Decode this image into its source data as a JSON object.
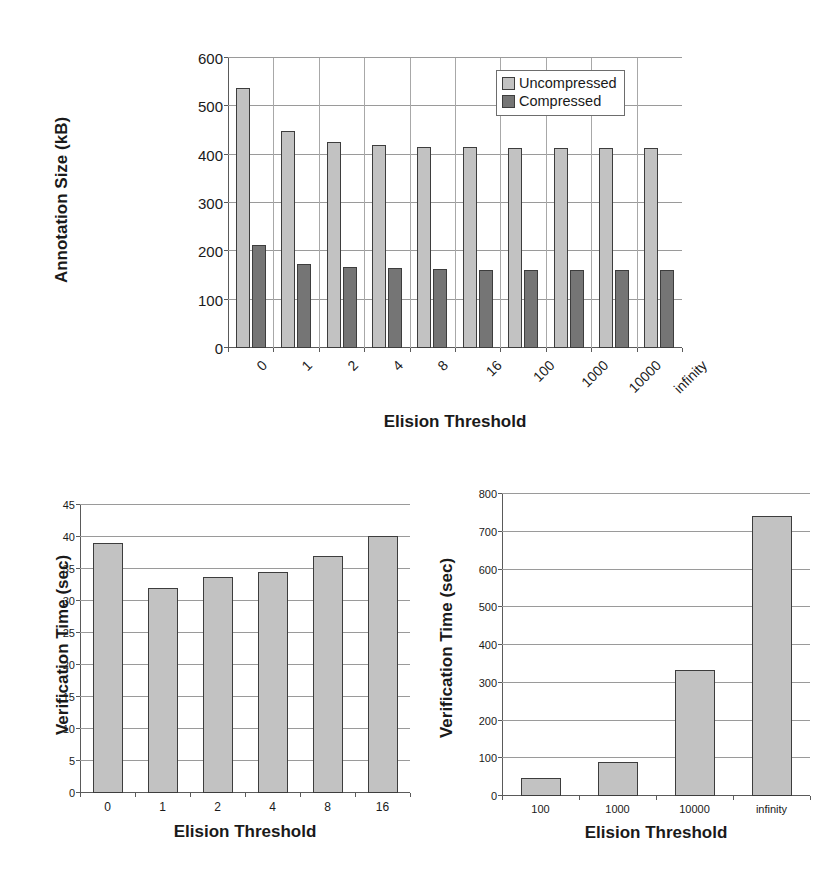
{
  "page": {
    "background": "#ffffff",
    "ink": "#1a1a1a"
  },
  "colors": {
    "uncompressed": "#c2c2c2",
    "compressed": "#757575",
    "bar_border": "#3d3d3d",
    "gridline": "#9a9a9a",
    "axis": "#5a5a5a"
  },
  "charts": [
    {
      "id": "annotation-size",
      "axis_title_x": "Elision Threshold",
      "axis_title_y": "Annotation Size (kB)",
      "legend": [
        {
          "label": "Uncompressed",
          "color": "#c2c2c2"
        },
        {
          "label": "Compressed",
          "color": "#757575"
        }
      ]
    },
    {
      "id": "verification-time-small",
      "axis_title_x": "Elision Threshold",
      "axis_title_y": "Verification Time (sec)"
    },
    {
      "id": "verification-time-large",
      "axis_title_x": "Elision Threshold",
      "axis_title_y": "Verification Time (sec)"
    }
  ],
  "chart_data": [
    {
      "type": "bar",
      "title": "",
      "xlabel": "Elision Threshold",
      "ylabel": "Annotation Size (kB)",
      "categories": [
        "0",
        "1",
        "2",
        "4",
        "8",
        "16",
        "100",
        "1000",
        "10000",
        "infinity"
      ],
      "series": [
        {
          "name": "Uncompressed",
          "color": "#c2c2c2",
          "values": [
            537,
            448,
            427,
            420,
            416,
            415,
            413,
            413,
            413,
            413
          ]
        },
        {
          "name": "Compressed",
          "color": "#757575",
          "values": [
            213,
            173,
            167,
            165,
            163,
            162,
            162,
            162,
            162,
            162
          ]
        }
      ],
      "ylim": [
        0,
        600
      ],
      "yticks": [
        0,
        100,
        200,
        300,
        400,
        500,
        600
      ],
      "ytick_labels": [
        "0",
        "100",
        "200",
        "300",
        "400",
        "500",
        "600"
      ],
      "grid": "horizontal+vertical",
      "legend_position": "top-right",
      "xtick_rotation": -45
    },
    {
      "type": "bar",
      "title": "",
      "xlabel": "Elision Threshold",
      "ylabel": "Verification Time (sec)",
      "categories": [
        "0",
        "1",
        "2",
        "4",
        "8",
        "16"
      ],
      "values": [
        39.0,
        32.1,
        33.7,
        34.6,
        37.1,
        40.2
      ],
      "ylim": [
        0,
        45
      ],
      "yticks": [
        0,
        5,
        10,
        15,
        20,
        25,
        30,
        35,
        40,
        45
      ],
      "ytick_labels": [
        "0",
        "5",
        "10",
        "15",
        "20",
        "25",
        "30",
        "35",
        "40",
        "45"
      ],
      "grid": "horizontal",
      "legend_position": "none",
      "bar_color": "#c2c2c2"
    },
    {
      "type": "bar",
      "title": "",
      "xlabel": "Elision Threshold",
      "ylabel": "Verification Time (sec)",
      "categories": [
        "100",
        "1000",
        "10000",
        "infinity"
      ],
      "values": [
        48,
        91,
        333,
        742
      ],
      "ylim": [
        0,
        800
      ],
      "yticks": [
        0,
        100,
        200,
        300,
        400,
        500,
        600,
        700,
        800
      ],
      "ytick_labels": [
        "0",
        "100",
        "200",
        "300",
        "400",
        "500",
        "600",
        "700",
        "800"
      ],
      "grid": "horizontal",
      "legend_position": "none",
      "bar_color": "#c2c2c2"
    }
  ]
}
